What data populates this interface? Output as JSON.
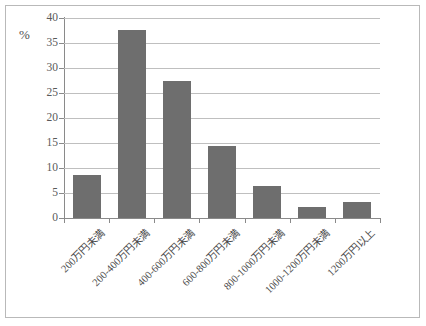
{
  "figure": {
    "background_color": "#ffffff",
    "frame_color": "#b9b9b9"
  },
  "axis": {
    "unit_label": "%",
    "y_ticks": [
      "40",
      "35",
      "30",
      "25",
      "20",
      "15",
      "10",
      "5",
      "0"
    ]
  },
  "chart_data": {
    "type": "bar",
    "title": "",
    "subtitle": "",
    "xlabel": "",
    "ylabel": "%",
    "ylim": [
      0,
      40
    ],
    "ytick_step": 5,
    "grid": true,
    "legend": false,
    "bar_color": "#6e6e6e",
    "categories": [
      "200万円未満",
      "200-400万円未満",
      "400-600万円未満",
      "600-800万円未満",
      "800-1000万円未満",
      "1000-1200万円未満",
      "1200万円以上"
    ],
    "values": [
      8.6,
      37.6,
      27.4,
      14.4,
      6.4,
      2.2,
      3.3
    ]
  }
}
